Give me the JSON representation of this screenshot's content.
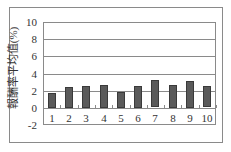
{
  "chart_data": {
    "type": "bar",
    "title": "",
    "xlabel": "",
    "ylabel": "報酬率平均值(%)",
    "categories": [
      "1",
      "2",
      "3",
      "4",
      "5",
      "6",
      "7",
      "8",
      "9",
      "10"
    ],
    "values": [
      1.7,
      2.4,
      2.6,
      2.7,
      1.9,
      2.6,
      3.2,
      2.7,
      3.1,
      2.5
    ],
    "ylim": [
      -2,
      10
    ],
    "yticks": [
      "10",
      "8",
      "6",
      "4",
      "2",
      "0",
      "-2"
    ],
    "grid": true,
    "legend": null,
    "bar_color": "#5a5a5a"
  }
}
